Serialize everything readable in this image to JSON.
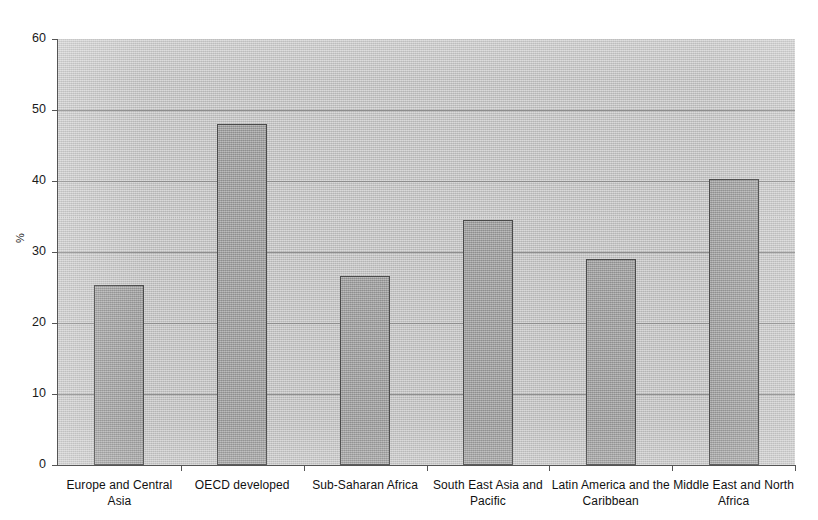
{
  "chart_data": {
    "type": "bar",
    "title": "",
    "subtitle": "",
    "xlabel": "",
    "ylabel": "%",
    "ylim": [
      0,
      60
    ],
    "ytick_step": 10,
    "yticks": [
      0,
      10,
      20,
      30,
      40,
      50,
      60
    ],
    "ytick_labels": [
      "0",
      "10",
      "20",
      "30",
      "40",
      "50",
      "60"
    ],
    "grid": {
      "horizontal_major": true,
      "horizontal_minor_dotted": true,
      "minor_values": [
        35
      ],
      "vertical": false,
      "legend": "none"
    },
    "legend": null,
    "categories": [
      "Europe and Central Asia",
      "OECD developed",
      "Sub-Saharan Africa",
      "South East Asia and Pacific",
      "Latin America and the Caribbean",
      "Middle East and North Africa"
    ],
    "values": [
      25.3,
      48.0,
      26.6,
      34.5,
      29.0,
      40.3
    ],
    "series": [
      {
        "name": "",
        "values": [
          25.3,
          48.0,
          26.6,
          34.5,
          29.0,
          40.3
        ]
      }
    ]
  },
  "style": {
    "plot_background": "#c2c2c2",
    "bar_fill": "#a2a2a2",
    "bar_border": "#4a4a4a",
    "gridline_color": "#8e8e8e",
    "minor_gridline_color": "#d3d3d3",
    "axis_color": "#555555",
    "text_color": "#111111",
    "page_background": "#ffffff"
  }
}
